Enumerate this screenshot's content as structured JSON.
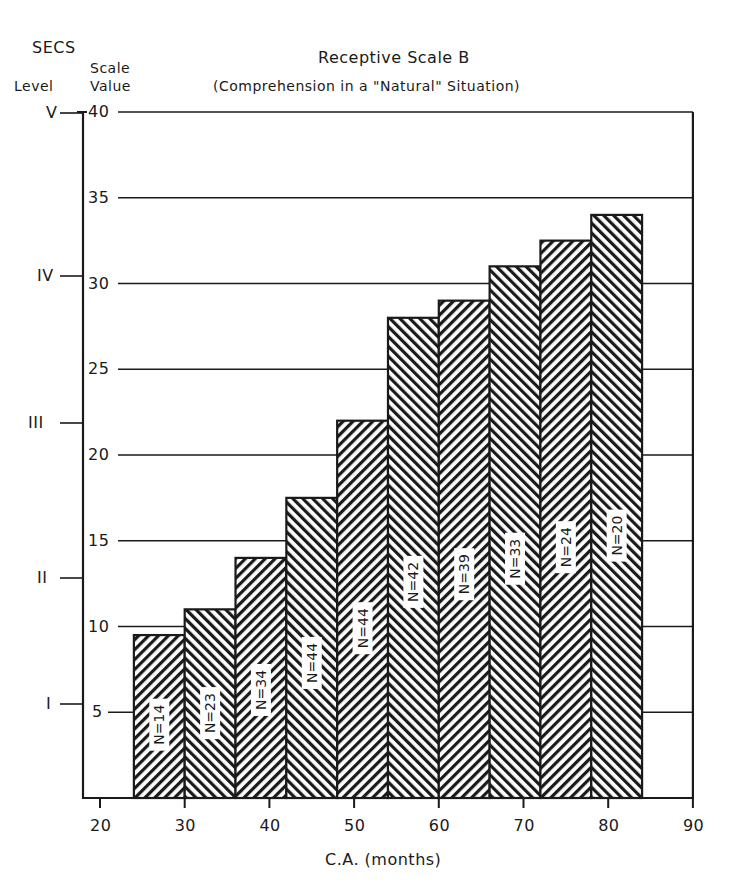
{
  "header": {
    "secs_label": "SECS",
    "level_label": "Level",
    "scale_label_1": "Scale",
    "scale_label_2": "Value"
  },
  "chart_data": {
    "type": "bar",
    "title": "Receptive Scale B",
    "subtitle": "(Comprehension in a \"Natural\" Situation)",
    "xlabel": "C.A. (months)",
    "ylabel": "Scale Value",
    "xlim": [
      20,
      90
    ],
    "ylim": [
      0,
      40
    ],
    "x_ticks": [
      20,
      30,
      40,
      50,
      60,
      70,
      80,
      90
    ],
    "y_ticks": [
      5,
      10,
      15,
      20,
      25,
      30,
      35,
      40
    ],
    "grid": "horizontal lines at 10, 15, 20, 25, 30, 35, 40",
    "secondary_axis": {
      "label": "SECS Level",
      "ticks": [
        {
          "label": "I",
          "value": 5.5
        },
        {
          "label": "II",
          "value": 13
        },
        {
          "label": "III",
          "value": 22
        },
        {
          "label": "IV",
          "value": 30.8
        },
        {
          "label": "V",
          "value": 40
        }
      ]
    },
    "bars": [
      {
        "x_start": 24,
        "x_end": 30,
        "value": 9.5,
        "n": "N=14"
      },
      {
        "x_start": 30,
        "x_end": 36,
        "value": 11,
        "n": "N=23"
      },
      {
        "x_start": 36,
        "x_end": 42,
        "value": 14,
        "n": "N=34"
      },
      {
        "x_start": 42,
        "x_end": 48,
        "value": 17.5,
        "n": "N=44"
      },
      {
        "x_start": 48,
        "x_end": 54,
        "value": 22,
        "n": "N=44"
      },
      {
        "x_start": 54,
        "x_end": 60,
        "value": 28,
        "n": "N=42"
      },
      {
        "x_start": 60,
        "x_end": 66,
        "value": 29,
        "n": "N=39"
      },
      {
        "x_start": 66,
        "x_end": 72,
        "value": 31,
        "n": "N=33"
      },
      {
        "x_start": 72,
        "x_end": 78,
        "value": 32.5,
        "n": "N=24"
      },
      {
        "x_start": 78,
        "x_end": 84,
        "value": 34,
        "n": "N=20"
      }
    ]
  }
}
